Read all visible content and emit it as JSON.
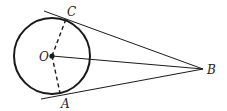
{
  "diagram": {
    "type": "geometry",
    "labels": {
      "O": "O",
      "A": "A",
      "B": "B",
      "C": "C"
    },
    "colors": {
      "stroke": "#1a1a1a",
      "background": "#ffffff"
    },
    "points": {
      "O": [
        52,
        56
      ],
      "A": [
        60,
        93
      ],
      "B": [
        203,
        69
      ],
      "C": [
        66,
        19
      ]
    },
    "circle": {
      "center": "O",
      "radius": 38
    }
  }
}
